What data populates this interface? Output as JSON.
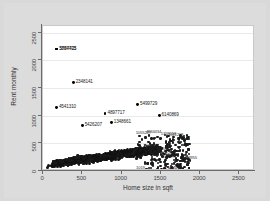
{
  "chart_data": {
    "type": "scatter",
    "title": "",
    "xlabel": "Home size in sqft",
    "ylabel": "Rent monthly",
    "xlim": [
      0,
      2700
    ],
    "ylim": [
      0,
      2620
    ],
    "xticks": [
      0,
      500,
      1000,
      1500,
      2000,
      2500
    ],
    "yticks": [
      0,
      500,
      1000,
      1500,
      2000,
      2500
    ],
    "xticklabels": [
      "0",
      "500",
      "1000",
      "1500",
      "2000",
      "2500"
    ],
    "yticklabels": [
      "0",
      "500",
      "1000",
      "1500",
      "2000",
      "2500"
    ],
    "grid": "horizontal",
    "legend": "none",
    "marker_color": "#111111",
    "panel_color": "#ffffff",
    "background_color": "#d9d9d9",
    "labeled_points": [
      {
        "id": "5897705",
        "x": 175,
        "y": 2205,
        "label_side": "right"
      },
      {
        "id": "3784423",
        "x": 175,
        "y": 2205,
        "label_side": "right"
      },
      {
        "id": "2348141",
        "x": 385,
        "y": 1600,
        "label_side": "right"
      },
      {
        "id": "4541310",
        "x": 172,
        "y": 1150,
        "label_side": "right"
      },
      {
        "id": "5499729",
        "x": 1205,
        "y": 1200,
        "label_side": "right"
      },
      {
        "id": "4897717",
        "x": 790,
        "y": 1045,
        "label_side": "right"
      },
      {
        "id": "6140869",
        "x": 1480,
        "y": 1000,
        "label_side": "right"
      },
      {
        "id": "1348661",
        "x": 870,
        "y": 880,
        "label_side": "right"
      },
      {
        "id": "5426207",
        "x": 500,
        "y": 820,
        "label_side": "right"
      },
      {
        "id": "5541988",
        "x": 1510,
        "y": 32,
        "label_side": "right"
      }
    ],
    "inner_labels": [
      {
        "id": "4834434",
        "x": 1285,
        "y": 700
      },
      {
        "id": "1358558",
        "x": 1475,
        "y": 660
      },
      {
        "id": "1011208",
        "x": 1570,
        "y": 645
      },
      {
        "id": "1055227",
        "x": 1155,
        "y": 690
      },
      {
        "id": "5583276",
        "x": 1480,
        "y": 255
      },
      {
        "id": "4463955",
        "x": 1740,
        "y": 235
      },
      {
        "id": "2387602",
        "x": 1390,
        "y": 395
      },
      {
        "id": "3340761",
        "x": 1250,
        "y": 455
      },
      {
        "id": "1192207",
        "x": 1455,
        "y": 330
      },
      {
        "id": "1019",
        "x": 1160,
        "y": 55
      }
    ],
    "cluster": {
      "description": "dense black point cloud",
      "x_range": [
        95,
        1870
      ],
      "y_range": [
        20,
        700
      ],
      "n_points": 1400,
      "x_center": 640,
      "y_center": 295
    }
  }
}
